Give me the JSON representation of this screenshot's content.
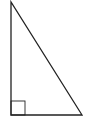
{
  "diagram": {
    "type": "right-triangle",
    "background": "#ffffff",
    "stroke_color": "#222222",
    "stroke_width": 1.3,
    "vertices": {
      "top": [
        11,
        2
      ],
      "bottom_left": [
        11,
        115
      ],
      "bottom_right": [
        82,
        115
      ]
    },
    "right_angle_marker": {
      "vertex": "bottom_left",
      "x": 11,
      "y": 101,
      "size": 14,
      "stroke_width": 0.9
    }
  }
}
